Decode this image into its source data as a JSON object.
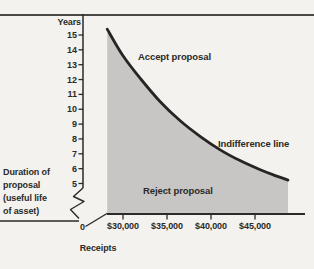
{
  "figure": {
    "y_axis_title": "Years",
    "x_axis_title": "Receipts",
    "origin_label": "0",
    "annotation_lines": [
      "Duration of",
      "proposal",
      "(useful life",
      "of asset)"
    ],
    "labels": {
      "accept_region": "Accept proposal",
      "reject_region": "Reject proposal",
      "curve": "Indifference line"
    },
    "colors": {
      "background": "#f3f2ee",
      "area_fill": "#c7c6c4",
      "ink": "#2b2a28",
      "curve": "#262523",
      "top_rule": "#4a4947"
    }
  },
  "chart_data": {
    "type": "area",
    "title": "",
    "xlabel": "Receipts",
    "ylabel": "Years",
    "x_tick_labels": [
      "$30,000",
      "$35,000",
      "$40,000",
      "$45,000"
    ],
    "x_tick_values": [
      30000,
      35000,
      40000,
      45000
    ],
    "y_ticks": [
      5,
      6,
      7,
      8,
      9,
      10,
      11,
      12,
      13,
      14,
      15
    ],
    "x_range_shown": [
      28200,
      48750
    ],
    "ylim": [
      5,
      15
    ],
    "axis_break_x": true,
    "axis_break_y": true,
    "grid": false,
    "legend": "none",
    "series": [
      {
        "name": "Indifference line",
        "points": [
          [
            28200,
            15.4
          ],
          [
            30000,
            13.6
          ],
          [
            32000,
            12.05
          ],
          [
            34200,
            10.52
          ],
          [
            36500,
            9.22
          ],
          [
            38800,
            8.16
          ],
          [
            41000,
            7.28
          ],
          [
            43300,
            6.54
          ],
          [
            45600,
            5.92
          ],
          [
            47300,
            5.53
          ],
          [
            48750,
            5.23
          ]
        ]
      }
    ],
    "regions": [
      {
        "label": "Accept proposal",
        "position": "above-curve"
      },
      {
        "label": "Reject proposal",
        "position": "below-curve",
        "shaded": true
      }
    ]
  }
}
